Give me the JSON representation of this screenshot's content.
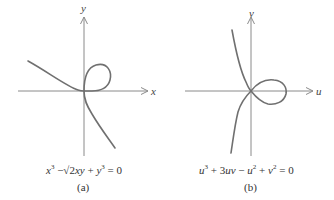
{
  "panels": [
    {
      "id": "a",
      "x_axis_label": "x",
      "y_axis_label": "y",
      "equation": "x^3 − √2xy + y^3 = 0",
      "equation_parts": {
        "t1": "x",
        "e1": "3",
        "t2": " −",
        "sqrt": "√2",
        "t3": "xy",
        "t4": " + ",
        "t5": "y",
        "e2": "3",
        "t6": " = 0"
      },
      "caption": "(a)"
    },
    {
      "id": "b",
      "x_axis_label": "u",
      "y_axis_label": "v",
      "equation": "u^3 + 3uv − u^2 + v^2 = 0",
      "equation_parts": {
        "t1": "u",
        "e1": "3",
        "t2": " + 3",
        "t3": "uv",
        "t4": " − ",
        "t5": "u",
        "e2": "2",
        "t6": " + ",
        "t7": "v",
        "e3": "2",
        "t8": " = 0"
      },
      "caption": "(b)"
    }
  ],
  "colors": {
    "curve": "#6e6e6e",
    "axis": "#8a8a8a",
    "text": "#333333"
  }
}
